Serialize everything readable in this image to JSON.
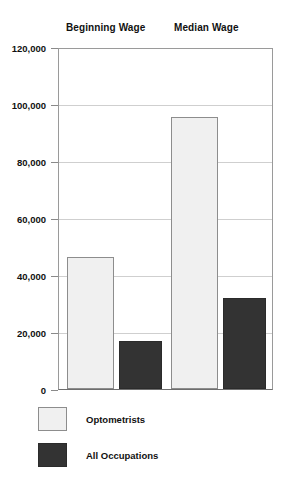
{
  "chart_data": {
    "type": "bar",
    "title": "",
    "subtitle": "",
    "xlabel": "",
    "ylabel": "",
    "categories": [
      "Beginning Wage",
      "Median Wage"
    ],
    "series": [
      {
        "name": "Optometrists",
        "color": "#f0f0f0",
        "values": [
          46500,
          96000
        ]
      },
      {
        "name": "All Occupations",
        "color": "#333333",
        "values": [
          17000,
          32000
        ]
      }
    ],
    "ylim": [
      0,
      120000
    ],
    "ytick_values": [
      0,
      20000,
      40000,
      60000,
      80000,
      100000,
      120000
    ],
    "ytick_labels": [
      "0",
      "20,000",
      "40,000",
      "60,000",
      "80,000",
      "100,000",
      "120,000"
    ],
    "grid": true,
    "grid_axis": "y",
    "legend_position": "bottom-left",
    "category_labels_position": "top"
  },
  "axis": {
    "ticks": [
      {
        "label": "120,000",
        "value": 120000
      },
      {
        "label": "100,000",
        "value": 100000
      },
      {
        "label": "80,000",
        "value": 80000
      },
      {
        "label": "60,000",
        "value": 60000
      },
      {
        "label": "40,000",
        "value": 40000
      },
      {
        "label": "20,000",
        "value": 20000
      },
      {
        "label": "0",
        "value": 0
      }
    ]
  },
  "groups": [
    {
      "label": "Beginning Wage"
    },
    {
      "label": "Median Wage"
    }
  ],
  "legend": {
    "items": [
      {
        "label": "Optometrists",
        "style": "light"
      },
      {
        "label": "All Occupations",
        "style": "dark"
      }
    ]
  }
}
